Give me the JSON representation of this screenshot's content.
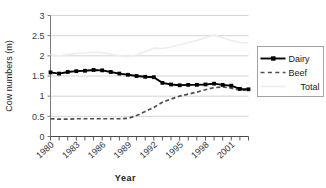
{
  "chart_data": {
    "type": "line",
    "title": "",
    "xlabel": "Year",
    "ylabel": "Cow numbers (m)",
    "ylim": [
      0,
      3
    ],
    "yticks": [
      "0",
      "0.5",
      "1",
      "1.5",
      "2",
      "2.5",
      "3"
    ],
    "ytick_values": [
      0,
      0.5,
      1,
      1.5,
      2,
      2.5,
      3
    ],
    "grid": "horizontal",
    "legend_position": "right",
    "x": [
      1980,
      1981,
      1982,
      1983,
      1984,
      1985,
      1986,
      1987,
      1988,
      1989,
      1990,
      1991,
      1992,
      1993,
      1994,
      1995,
      1996,
      1997,
      1998,
      1999,
      2000,
      2001,
      2002,
      2003
    ],
    "xtick_labels": [
      "1980",
      "1983",
      "1986",
      "1989",
      "1992",
      "1995",
      "1998",
      "2001"
    ],
    "xtick_label_values": [
      1980,
      1983,
      1986,
      1989,
      1992,
      1995,
      1998,
      2001
    ],
    "series": [
      {
        "name": "Dairy",
        "style": "solid-marker",
        "color": "#000000",
        "values": [
          1.59,
          1.56,
          1.6,
          1.62,
          1.63,
          1.65,
          1.64,
          1.6,
          1.56,
          1.53,
          1.5,
          1.48,
          1.47,
          1.33,
          1.29,
          1.27,
          1.28,
          1.28,
          1.29,
          1.31,
          1.28,
          1.26,
          1.18,
          1.17
        ]
      },
      {
        "name": "Beef",
        "style": "dashed",
        "color": "#4d4d4d",
        "values": [
          0.44,
          0.43,
          0.43,
          0.44,
          0.44,
          0.44,
          0.44,
          0.44,
          0.44,
          0.45,
          0.52,
          0.62,
          0.72,
          0.85,
          0.93,
          1.0,
          1.05,
          1.1,
          1.16,
          1.21,
          1.23,
          1.2,
          1.15,
          1.15
        ]
      },
      {
        "name": "Total",
        "style": "solid-light",
        "color": "#ededed",
        "values": [
          2.03,
          2.0,
          2.03,
          2.06,
          2.07,
          2.09,
          2.08,
          2.04,
          2.0,
          1.98,
          2.02,
          2.1,
          2.19,
          2.18,
          2.22,
          2.27,
          2.33,
          2.38,
          2.45,
          2.52,
          2.45,
          2.38,
          2.33,
          2.32
        ]
      }
    ]
  },
  "legend": {
    "items": [
      {
        "label": "Dairy"
      },
      {
        "label": "Beef"
      },
      {
        "label": "Total"
      }
    ]
  },
  "axes": {
    "y_title": "Cow numbers (m)",
    "x_title": "Year"
  }
}
